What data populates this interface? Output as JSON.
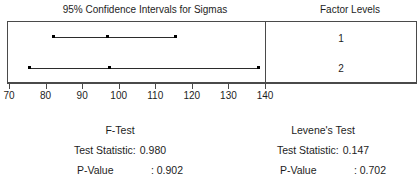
{
  "chart_data": {
    "type": "line",
    "title": "95% Confidence Intervals for Sigmas",
    "xlabel": "",
    "ylabel": "Factor Levels",
    "xlim": [
      70,
      140
    ],
    "xticks": [
      70,
      80,
      90,
      100,
      110,
      120,
      130,
      140
    ],
    "grid": false,
    "legend": "none",
    "series": [
      {
        "name": "1",
        "lower": 82.3,
        "center": 96.8,
        "upper": 115.4
      },
      {
        "name": "2",
        "lower": 75.7,
        "center": 97.6,
        "upper": 138.1
      }
    ]
  },
  "left_panel": {
    "title": "95% Confidence Intervals for Sigmas"
  },
  "right_panel": {
    "title": "Factor Levels",
    "levels": [
      "1",
      "2"
    ]
  },
  "axis": {
    "ticks": [
      "70",
      "80",
      "90",
      "100",
      "110",
      "120",
      "130",
      "140"
    ]
  },
  "tests": [
    {
      "name": "F-Test",
      "statistic_label": "Test Statistic:",
      "statistic_value": "0.980",
      "pvalue_label": "P-Value",
      "pvalue_value": ": 0.902"
    },
    {
      "name": "Levene's Test",
      "statistic_label": "Test Statistic:",
      "statistic_value": "0.147",
      "pvalue_label": "P-Value",
      "pvalue_value": ": 0.702"
    }
  ],
  "colors": {
    "line": "#2b2b2b",
    "frame": "#4a4a4a",
    "text": "#1d1d1d",
    "background": "#ffffff"
  }
}
